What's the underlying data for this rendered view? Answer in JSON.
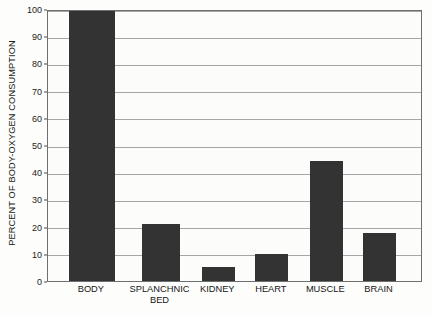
{
  "chart_data": {
    "type": "bar",
    "title": "",
    "subtitle": "",
    "xlabel": "",
    "ylabel": "PERCENT OF BODY-OXYGEN CONSUMPTION",
    "categories": [
      "BODY",
      "SPLANCHNIC\nBED",
      "KIDNEY",
      "HEART",
      "MUSCLE",
      "BRAIN"
    ],
    "values": [
      100,
      21,
      5,
      10,
      44,
      17.5
    ],
    "ylim": [
      0,
      100
    ],
    "yticks": [
      0,
      10,
      20,
      30,
      40,
      50,
      60,
      70,
      80,
      90,
      100
    ],
    "ytick_labels": [
      "0",
      "10",
      "20",
      "30",
      "40",
      "50",
      "60",
      "70",
      "80",
      "90",
      "100"
    ],
    "grid": true,
    "legend": false,
    "legend_position": "none",
    "bar_color": "#333333",
    "gridline_color": "#a6a6a6",
    "axis_color": "#6f6f6f",
    "background_color": "#fcfcfa",
    "bar_widths_px": [
      46,
      38,
      33,
      33,
      33,
      33
    ],
    "bar_centers_pct": [
      11.7,
      30.0,
      45.4,
      59.7,
      74.2,
      88.4
    ]
  }
}
